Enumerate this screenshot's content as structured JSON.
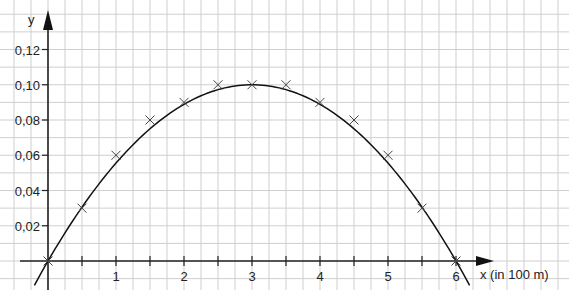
{
  "chart_data": {
    "type": "scatter",
    "title": "",
    "xlabel": "x (in 100 m)",
    "ylabel": "y",
    "x_ticks": [
      "1",
      "2",
      "3",
      "4",
      "5",
      "6"
    ],
    "x_minor_ticks": [
      0.5,
      1.5,
      2.5,
      3.5,
      4.5,
      5.5
    ],
    "y_ticks": [
      "0,02",
      "0,04",
      "0,06",
      "0,08",
      "0,10",
      "0,12"
    ],
    "xlim": [
      -0.4,
      7.6
    ],
    "ylim": [
      -0.016,
      0.136
    ],
    "grid": true,
    "legend": null,
    "series": [
      {
        "name": "measured points",
        "marker": "x",
        "x": [
          0,
          0.5,
          1,
          1.5,
          2,
          2.5,
          3,
          3.5,
          4,
          4.5,
          5,
          5.5,
          6
        ],
        "y": [
          0,
          0.03,
          0.06,
          0.08,
          0.09,
          0.1,
          0.1,
          0.1,
          0.09,
          0.08,
          0.06,
          0.03,
          0
        ]
      },
      {
        "name": "fitted parabola",
        "style": "line",
        "function": "y = -x(x-6)/90",
        "x": [
          -0.2,
          0,
          1,
          2,
          3,
          4,
          5,
          6,
          6.2
        ],
        "y": [
          -0.0138,
          0,
          0.0556,
          0.0889,
          0.1,
          0.0889,
          0.0556,
          0,
          -0.0138
        ]
      }
    ]
  },
  "labels": {
    "y_axis": "y",
    "x_axis": "x (in 100 m)"
  }
}
